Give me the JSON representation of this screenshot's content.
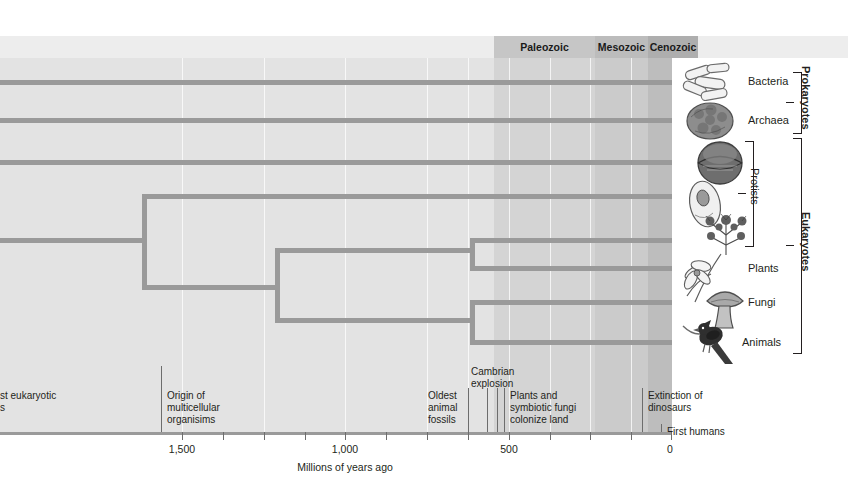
{
  "eras": [
    {
      "name": "Paleozoic",
      "start_mya": 542,
      "end_mya": 251,
      "x": 494,
      "w": 154,
      "label_x": 494,
      "label_w": 154,
      "color": "#c7c7c7"
    },
    {
      "name": "Mesozoic",
      "start_mya": 251,
      "end_mya": 65,
      "x": 595,
      "w": 53,
      "label_x": 595,
      "label_w": 53,
      "color": "#bdbdbd"
    },
    {
      "name": "Cenozoic",
      "start_mya": 65,
      "end_mya": 0,
      "x": 648,
      "w": 50,
      "label_x": 648,
      "label_w": 50,
      "color": "#b0b0b0"
    }
  ],
  "axis": {
    "title": "Millions of years ago",
    "title_x": 345,
    "direction": "right-to-left",
    "ticks": [
      {
        "label": "1,500",
        "x": 182,
        "major": true
      },
      {
        "label": "",
        "x": 264,
        "major": false
      },
      {
        "label": "1,000",
        "x": 345,
        "major": true
      },
      {
        "label": "",
        "x": 427,
        "major": false
      },
      {
        "label": "",
        "x": 468,
        "major": false
      },
      {
        "label": "",
        "x": 509,
        "major": false
      },
      {
        "label": "500",
        "x": 509,
        "major": true
      },
      {
        "label": "",
        "x": 590,
        "major": false
      },
      {
        "label": "",
        "x": 631,
        "major": false
      },
      {
        "label": "0",
        "x": 672,
        "major": true
      }
    ],
    "tick_x": [
      182,
      223,
      264,
      305,
      345,
      386,
      427,
      468,
      509,
      550,
      590,
      631,
      656,
      672
    ],
    "labels": [
      {
        "text": "1,500",
        "x": 182
      },
      {
        "text": "1,000",
        "x": 345
      },
      {
        "text": "500",
        "x": 509
      },
      {
        "text": "0",
        "x": 672
      }
    ]
  },
  "events": [
    {
      "name": "first-eukaryotic-cells",
      "text": "st eukaryotic\ns",
      "label_x": 0,
      "label_y": 392,
      "line_x": -1,
      "line_top": 0,
      "line_bottom": 0
    },
    {
      "name": "origin-of-multicellular-organisms",
      "text": "Origin of\nmulticellular\norganisims",
      "label_x": 167,
      "label_y": 392,
      "line_x": 161,
      "line_top": 366,
      "line_bottom": 432
    },
    {
      "name": "oldest-animal-fossils",
      "text": "Oldest\nanimal\nfossils",
      "label_x": 428,
      "label_y": 392,
      "line_x": 468,
      "line_top": 388,
      "line_bottom": 432
    },
    {
      "name": "cambrian-explosion",
      "text": "Cambrian\nexplosion",
      "label_x": 471,
      "label_y": 367,
      "line_x": 494,
      "line_top": 388,
      "line_bottom": 432
    },
    {
      "name": "plants-and-symbiotic-fungi-colonize-land",
      "text": "Plants and\nsymbiotic fungi\ncolonize land",
      "label_x": 509,
      "label_y": 392,
      "line_x": 503,
      "line_top": 388,
      "line_bottom": 432
    },
    {
      "name": "extinction-of-dinosaurs",
      "text": "Extinction of\ndinosaurs",
      "label_x": 648,
      "label_y": 392,
      "line_x": 642,
      "line_top": 388,
      "line_bottom": 432
    },
    {
      "name": "first-humans",
      "text": "First humans",
      "label_x": 666,
      "label_y": 428,
      "line_x": 661,
      "line_top": 424,
      "line_bottom": 432
    }
  ],
  "taxa": [
    {
      "name": "Bacteria",
      "label_x": 748,
      "label_y": 75,
      "tip_y": 82
    },
    {
      "name": "Archaea",
      "label_x": 748,
      "label_y": 114,
      "tip_y": 120
    },
    {
      "name": "Protists",
      "label_x": 0,
      "label_y": 0,
      "tip_y": 162
    },
    {
      "name": "Plants",
      "label_x": 748,
      "label_y": 262,
      "tip_y": 268
    },
    {
      "name": "Fungi",
      "label_x": 748,
      "label_y": 296,
      "tip_y": 302
    },
    {
      "name": "Animals",
      "label_x": 741,
      "label_y": 336,
      "tip_y": 342
    }
  ],
  "groups": [
    {
      "name": "Prokaryotes",
      "bold": true
    },
    {
      "name": "Protists",
      "bold": false
    },
    {
      "name": "Eukaryotes",
      "bold": true
    }
  ],
  "tree": {
    "tip_x": 672,
    "line_color": "#9a9a9a",
    "tips": [
      {
        "taxon": "Bacteria",
        "y": 82,
        "from_x": 0
      },
      {
        "taxon": "Archaea",
        "y": 120,
        "from_x": 0
      },
      {
        "taxon": "Protist-1",
        "y": 162,
        "from_x": 0
      },
      {
        "taxon": "Protist-2",
        "y": 196,
        "from_x": 142
      },
      {
        "taxon": "Protist-3",
        "y": 240,
        "from_x": 470
      },
      {
        "taxon": "Plants",
        "y": 268,
        "from_x": 470
      },
      {
        "taxon": "Fungi",
        "y": 302,
        "from_x": 470
      },
      {
        "taxon": "Animals",
        "y": 342,
        "from_x": 470
      }
    ],
    "nodes": [
      {
        "name": "root",
        "x": 142,
        "y_top": 196,
        "y_bottom": 287,
        "stem_from_x": 0,
        "stem_y": 240
      },
      {
        "name": "node-b",
        "x": 275,
        "y_top": 250,
        "y_bottom": 320,
        "stem_from_x": 142,
        "stem_y": 287
      },
      {
        "name": "node-c",
        "x": 470,
        "y_top": 240,
        "y_bottom": 268,
        "stem_from_x": 275,
        "stem_y": 250
      },
      {
        "name": "node-d",
        "x": 470,
        "y_top": 302,
        "y_bottom": 342,
        "stem_from_x": 275,
        "stem_y": 320
      }
    ]
  },
  "colors": {
    "plot_bg": "#e3e3e3",
    "header_bar": "#ededed",
    "branch": "#9a9a9a",
    "text": "#231f20",
    "axis": "#9a9a9a"
  }
}
